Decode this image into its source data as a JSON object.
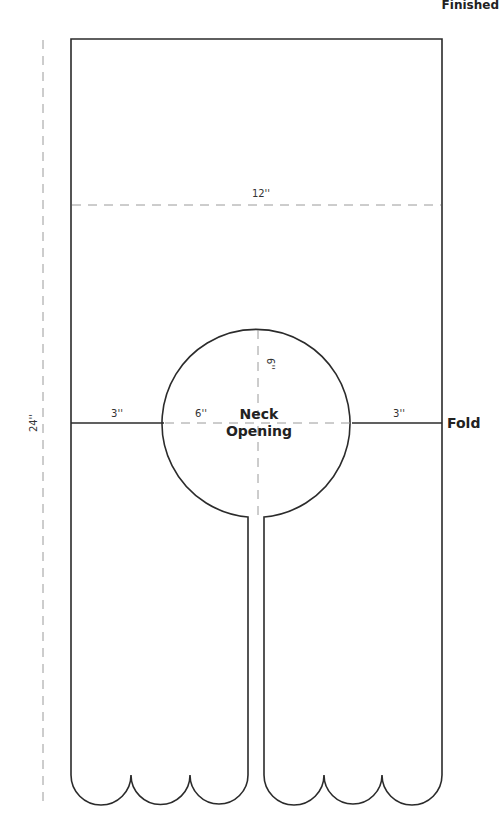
{
  "header": {
    "title_fragment": "Finished"
  },
  "diagram": {
    "type": "sewing-pattern",
    "labels": {
      "height": "24''",
      "width": "12''",
      "left_shoulder": "3''",
      "right_shoulder": "3''",
      "neck_diameter_h": "6''",
      "neck_diameter_v": "6''",
      "neck_line1": "Neck",
      "neck_line2": "Opening",
      "fold": "Fold"
    },
    "colors": {
      "outline": "#2b2b2b",
      "dashed": "#9a9a9a",
      "background": "#ffffff"
    }
  }
}
